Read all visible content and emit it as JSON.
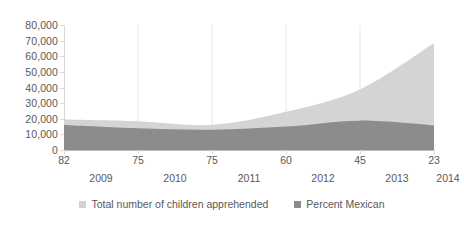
{
  "chart_data": {
    "type": "area",
    "title": "",
    "subtitle": "",
    "xlabel": "",
    "ylabel": "",
    "grid": "vertical",
    "legend_position": "bottom",
    "ylim": [
      0,
      80000
    ],
    "y_ticks": [
      "0",
      "10,000",
      "20,000",
      "30,000",
      "40,000",
      "50,000",
      "60,000",
      "70,000",
      "80,000"
    ],
    "y_tick_values": [
      0,
      10000,
      20000,
      30000,
      40000,
      50000,
      60000,
      70000,
      80000
    ],
    "categories": [
      "2009",
      "2010",
      "2011",
      "2012",
      "2013",
      "2014"
    ],
    "x_percent_labels": [
      "82",
      "75",
      "75",
      "60",
      "45",
      "23"
    ],
    "x_percent_values": [
      82,
      75,
      75,
      60,
      45,
      23
    ],
    "series": [
      {
        "name": "Total number of children apprehended",
        "color": "#d4d4d4",
        "values": [
          19500,
          18400,
          16100,
          24500,
          38800,
          68500
        ]
      },
      {
        "name": "Percent Mexican",
        "color": "#8c8c8c",
        "values": [
          16000,
          13900,
          13000,
          15000,
          18800,
          15700
        ]
      }
    ]
  },
  "legend": {
    "items": [
      {
        "label": "Total number of children apprehended",
        "color": "#d4d4d4"
      },
      {
        "label": "Percent Mexican",
        "color": "#8c8c8c"
      }
    ]
  }
}
